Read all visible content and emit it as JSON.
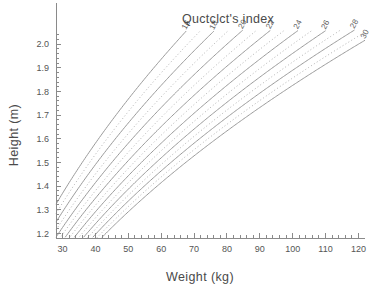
{
  "chart_data": {
    "type": "line",
    "title": "Quctclct's index",
    "xlabel": "Weight (kg)",
    "ylabel": "Height (m)",
    "xlim": [
      28,
      122
    ],
    "ylim": [
      1.18,
      2.06
    ],
    "grid": false,
    "legend": "curve-end-labels",
    "x_ticks": [
      30,
      40,
      50,
      60,
      70,
      80,
      90,
      100,
      110,
      120
    ],
    "x_tick_labels": [
      "30",
      "40",
      "50",
      "60",
      "70",
      "80",
      "90",
      "100",
      "110",
      "120"
    ],
    "x_minor_step": 2,
    "y_ticks": [
      1.2,
      1.3,
      1.4,
      1.5,
      1.6,
      1.7,
      1.8,
      1.9,
      2.0
    ],
    "y_tick_labels": [
      "1.2",
      "1.3",
      "1.4",
      "1.5",
      "1.6",
      "1.7",
      "1.8",
      "1.9",
      "2.0"
    ],
    "relation": "height = sqrt(weight / bmi)",
    "series": [
      {
        "name": "16",
        "bmi": 16,
        "style": "solid",
        "labeled": true,
        "label": "16"
      },
      {
        "name": "17",
        "bmi": 17,
        "style": "dotted",
        "labeled": false,
        "label": ""
      },
      {
        "name": "18",
        "bmi": 18,
        "style": "solid",
        "labeled": true,
        "label": "18"
      },
      {
        "name": "19",
        "bmi": 19,
        "style": "dotted",
        "labeled": false,
        "label": ""
      },
      {
        "name": "20",
        "bmi": 20,
        "style": "solid",
        "labeled": true,
        "label": "20"
      },
      {
        "name": "21",
        "bmi": 21,
        "style": "dotted",
        "labeled": false,
        "label": ""
      },
      {
        "name": "22",
        "bmi": 22,
        "style": "solid",
        "labeled": true,
        "label": "22"
      },
      {
        "name": "23",
        "bmi": 23,
        "style": "dotted",
        "labeled": false,
        "label": ""
      },
      {
        "name": "24",
        "bmi": 24,
        "style": "solid",
        "labeled": true,
        "label": "24"
      },
      {
        "name": "25",
        "bmi": 25,
        "style": "dotted",
        "labeled": false,
        "label": ""
      },
      {
        "name": "26",
        "bmi": 26,
        "style": "solid",
        "labeled": true,
        "label": "26"
      },
      {
        "name": "27",
        "bmi": 27,
        "style": "dotted",
        "labeled": false,
        "label": ""
      },
      {
        "name": "28",
        "bmi": 28,
        "style": "solid",
        "labeled": true,
        "label": "28"
      },
      {
        "name": "29",
        "bmi": 29,
        "style": "dotted",
        "labeled": false,
        "label": ""
      },
      {
        "name": "30",
        "bmi": 30,
        "style": "solid",
        "labeled": true,
        "label": "30"
      }
    ],
    "colors": {
      "solid_curve": "#9a9a9a",
      "dotted_curve": "#b2b2b2",
      "axis": "#8a8a8a",
      "text": "#4a4a4a",
      "background": "#ffffff"
    }
  }
}
